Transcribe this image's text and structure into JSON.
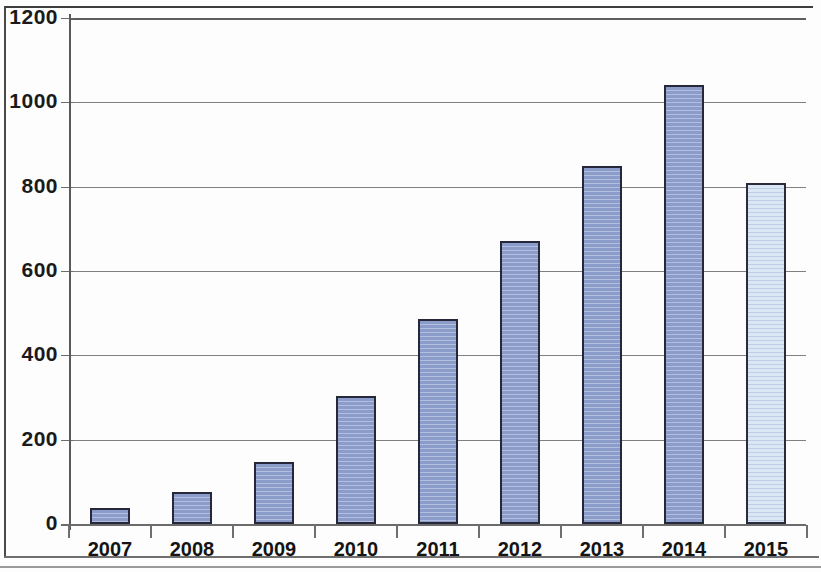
{
  "chart_data": {
    "type": "bar",
    "title": "",
    "subtitle": "",
    "xlabel": "",
    "ylabel": "",
    "categories": [
      "2007",
      "2008",
      "2009",
      "2010",
      "2011",
      "2012",
      "2013",
      "2014",
      "2015"
    ],
    "values": [
      37,
      77,
      148,
      303,
      487,
      672,
      850,
      1040,
      808
    ],
    "series": [
      {
        "name": "",
        "values": [
          37,
          77,
          148,
          303,
          487,
          672,
          850,
          1040,
          808
        ]
      }
    ],
    "ylim": [
      0,
      1200
    ],
    "y_ticks": [
      0,
      200,
      400,
      600,
      800,
      1000,
      1200
    ],
    "y_tick_labels": [
      "0",
      "200",
      "400",
      "600",
      "800",
      "1000",
      "1200"
    ],
    "grid": true,
    "grid_axis": "y",
    "legend": null,
    "legend_position": "none",
    "annotations": [],
    "bar_fill_color": "#8b9cca",
    "bar_edge_color": "#27273a",
    "projected_bar_fill_color": "#dce7f5",
    "projected_categories": [
      "2015"
    ],
    "axis_color": "#6b6b6b",
    "gridline_color": "#808080",
    "background_color": "#ffffff",
    "text_color": "#141414"
  }
}
